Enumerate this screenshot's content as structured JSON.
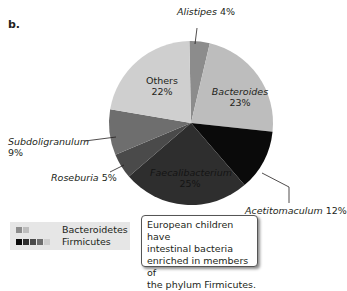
{
  "panel_label": "b.",
  "chart_data": {
    "type": "pie",
    "title": "",
    "slices": [
      {
        "label": "Alistipes",
        "value": 4,
        "phylum": "Bacteroidetes",
        "color": "#8c8c8c"
      },
      {
        "label": "Bacteroides",
        "value": 23,
        "phylum": "Bacteroidetes",
        "color": "#bdbdbd"
      },
      {
        "label": "Acetitomaculum",
        "value": 12,
        "phylum": "Firmicutes",
        "color": "#0a0a0a"
      },
      {
        "label": "Faecalibacterium",
        "value": 25,
        "phylum": "Firmicutes",
        "color": "#2e2e2e"
      },
      {
        "label": "Roseburia",
        "value": 5,
        "phylum": "Firmicutes",
        "color": "#4a4a4a"
      },
      {
        "label": "Subdoligranulum",
        "value": 9,
        "phylum": "Firmicutes",
        "color": "#6e6e6e"
      },
      {
        "label": "Others",
        "value": 22,
        "phylum": "",
        "color": "#cfcfcf"
      }
    ],
    "legend": [
      {
        "label": "Bacteroidetes",
        "swatches": [
          "#8c8c8c",
          "#bdbdbd"
        ]
      },
      {
        "label": "Firmicutes",
        "swatches": [
          "#0a0a0a",
          "#2e2e2e",
          "#4a4a4a",
          "#6e6e6e",
          "#cfcfcf"
        ]
      }
    ],
    "legend_position": "bottom-left"
  },
  "labels": {
    "alistipes_name": "Alistipes",
    "alistipes_pct": "4%",
    "bacteroides_name": "Bacteroides",
    "bacteroides_pct": "23%",
    "others_name": "Others",
    "others_pct": "22%",
    "subdoligranulum_name": "Subdoligranulum",
    "subdoligranulum_pct": "9%",
    "roseburia_name": "Roseburia",
    "roseburia_pct": "5%",
    "faecalibacterium_name": "Faecalibacterium",
    "faecalibacterium_pct": "25%",
    "acetitomaculum_name": "Acetitomaculum",
    "acetitomaculum_pct": "12%"
  },
  "legend": {
    "bacteroidetes": "Bacteroidetes",
    "firmicutes": "Firmicutes"
  },
  "callout": {
    "line1": "European children have",
    "line2": "intestinal bacteria",
    "line3": "enriched in members of",
    "line4": "the phylum Firmicutes."
  }
}
